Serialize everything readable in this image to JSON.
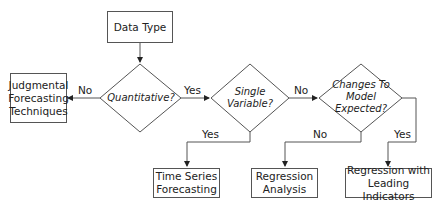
{
  "start": {
    "label": "Data Type"
  },
  "decisions": [
    {
      "id": "quantitative",
      "label": "Quantitative?"
    },
    {
      "id": "single_variable",
      "label": "Single Variable?"
    },
    {
      "id": "changes_expected",
      "label": "Changes To Model Expected?"
    }
  ],
  "outcomes": [
    {
      "id": "judgmental",
      "label": "Judgmental Forecasting Techniques"
    },
    {
      "id": "time_series",
      "label": "Time Series Forecasting"
    },
    {
      "id": "regression",
      "label": "Regression Analysis"
    },
    {
      "id": "regression_leading",
      "label": "Regression with Leading Indicators"
    }
  ],
  "edges": {
    "quant_no": "No",
    "quant_yes": "Yes",
    "single_yes": "Yes",
    "single_no": "No",
    "changes_no": "No",
    "changes_yes": "Yes"
  },
  "colors": {
    "stroke": "#555555",
    "arrow": "#222222",
    "text": "#222222"
  }
}
